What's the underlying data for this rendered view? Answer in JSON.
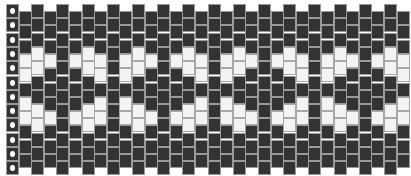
{
  "pattern": {
    "type": "peyote bead pattern",
    "colors": {
      "dark": "#333333",
      "light": "#f3f3f3",
      "marker_dot": "#ffffff"
    },
    "column_count": 32,
    "column_pitch_px": 12.6,
    "bead_pitch_px": 14.3,
    "even_column_top_px": 4,
    "odd_column_top_px": 11,
    "column_types": {
      "M": "MMMMMMMMMMMM",
      "A": "DDDWWDWWDDD",
      "B": "DDDWWDDWWDDD",
      "C": "DDDWDDDWDDD",
      "F_even": "DDDDDDDDDDDD",
      "F_odd": "DDDDDDDDDDD"
    },
    "columns": [
      "M",
      "A",
      "B",
      "C",
      "F_even",
      "C",
      "B",
      "A",
      "F_even",
      "A",
      "B",
      "C",
      "F_even",
      "C",
      "B",
      "A",
      "F_even",
      "A",
      "B",
      "C",
      "F_even",
      "C",
      "B",
      "A",
      "F_even",
      "A",
      "B",
      "C",
      "F_even",
      "C",
      "B",
      "A"
    ]
  }
}
